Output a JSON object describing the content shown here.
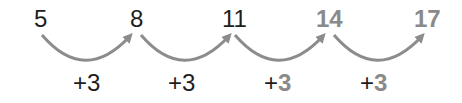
{
  "sequence": {
    "numbers": [
      {
        "value": "5",
        "emphasis": false
      },
      {
        "value": "8",
        "emphasis": false
      },
      {
        "value": "11",
        "emphasis": false
      },
      {
        "value": "14",
        "emphasis": true
      },
      {
        "value": "17",
        "emphasis": true
      }
    ],
    "steps": [
      {
        "sign": "+",
        "value": "3",
        "emphasis": false
      },
      {
        "sign": "+",
        "value": "3",
        "emphasis": false
      },
      {
        "sign": "+",
        "value": "3",
        "emphasis": true
      },
      {
        "sign": "+",
        "value": "3",
        "emphasis": true
      }
    ],
    "colors": {
      "text": "#1e1e1e",
      "emphasis": "#8a8a8a",
      "arrow": "#8c8c8c"
    }
  }
}
